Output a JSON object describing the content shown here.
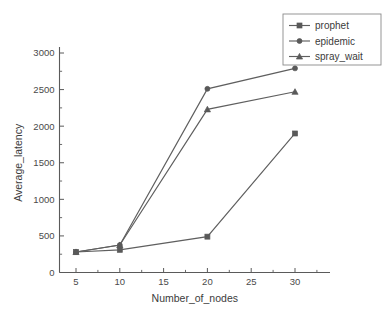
{
  "chart_data": {
    "type": "line",
    "title": "",
    "xlabel": "Number_of_nodes",
    "ylabel": "Average_latency",
    "x": [
      5,
      10,
      20,
      30
    ],
    "xlim": [
      2.5,
      32.5
    ],
    "ylim": [
      0,
      3000
    ],
    "xticks": [
      5,
      10,
      15,
      20,
      25,
      30
    ],
    "xtick_labels": [
      "5",
      "10",
      "15",
      "20",
      "25",
      "30"
    ],
    "yticks": [
      0,
      500,
      1000,
      1500,
      2000,
      2500,
      3000
    ],
    "ytick_labels": [
      "0",
      "500",
      "1000",
      "1500",
      "2000",
      "2500",
      "3000"
    ],
    "grid": false,
    "legend_position": "top-right",
    "series": [
      {
        "name": "prophet",
        "marker": "square",
        "color": "#595959",
        "values": [
          280,
          310,
          490,
          1900
        ]
      },
      {
        "name": "epidemic",
        "marker": "circle",
        "color": "#595959",
        "values": [
          280,
          375,
          2510,
          2790
        ]
      },
      {
        "name": "spray_wait",
        "marker": "triangle",
        "color": "#595959",
        "values": [
          280,
          375,
          2230,
          2470
        ]
      }
    ]
  },
  "legend": {
    "items": [
      {
        "label": "prophet"
      },
      {
        "label": "epidemic"
      },
      {
        "label": "spray_wait"
      }
    ]
  },
  "axes": {
    "x_title": "Number_of_nodes",
    "y_title": "Average_latency"
  }
}
